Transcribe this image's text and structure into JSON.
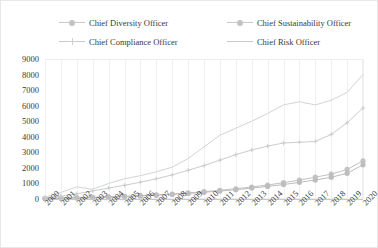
{
  "chart_data": {
    "type": "line",
    "title": "",
    "xlabel": "",
    "ylabel": "",
    "ylim": [
      0,
      9000
    ],
    "ytick_step": 1000,
    "grid": "vertical",
    "legend_position": "top",
    "yticks": [
      "9000",
      "8000",
      "7000",
      "6000",
      "5000",
      "4000",
      "3000",
      "2000",
      "1000",
      "0"
    ],
    "categories": [
      "2000",
      "2001",
      "2002",
      "2003",
      "2004",
      "2005",
      "2006",
      "2007",
      "2008",
      "2009",
      "2010",
      "2011",
      "2012",
      "2013",
      "2014",
      "2015",
      "2016",
      "2017",
      "2018",
      "2019",
      "2020"
    ],
    "series": [
      {
        "name": "Chief Diversity Officer",
        "marker": "circle",
        "color": "#c2c2c2",
        "values": [
          40,
          60,
          85,
          110,
          140,
          175,
          215,
          265,
          320,
          390,
          470,
          560,
          660,
          770,
          900,
          1050,
          1220,
          1400,
          1600,
          1900,
          2450
        ]
      },
      {
        "name": "Chief Sustainability Officer",
        "marker": "circle",
        "color": "#bdbdbd",
        "values": [
          30,
          45,
          65,
          90,
          120,
          155,
          195,
          240,
          295,
          360,
          430,
          510,
          600,
          700,
          810,
          930,
          1070,
          1220,
          1400,
          1650,
          2200
        ]
      },
      {
        "name": "Chief Compliance Officer",
        "marker": "cross",
        "color": "#cccccc",
        "values": [
          80,
          180,
          330,
          520,
          700,
          880,
          1080,
          1300,
          1550,
          1850,
          2150,
          2500,
          2850,
          3150,
          3400,
          3600,
          3650,
          3700,
          4150,
          4900,
          5850
        ]
      },
      {
        "name": "Chief Risk Officer",
        "marker": "none",
        "color": "#d4d4d4",
        "values": [
          120,
          420,
          780,
          620,
          1000,
          1300,
          1500,
          1750,
          2050,
          2600,
          3350,
          4100,
          4550,
          5000,
          5500,
          6050,
          6250,
          6050,
          6350,
          6850,
          8000
        ]
      }
    ]
  }
}
